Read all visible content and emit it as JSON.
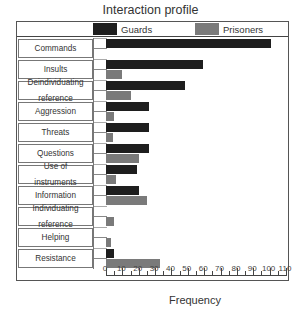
{
  "chart_data": {
    "type": "bar",
    "orientation": "horizontal",
    "title": "Interaction profile",
    "xlabel": "Frequency",
    "ylabel": "",
    "xlim": [
      0,
      110
    ],
    "xticks": [
      0,
      10,
      20,
      30,
      40,
      50,
      60,
      70,
      80,
      90,
      100,
      110
    ],
    "grid": false,
    "legend_position": "top",
    "categories": [
      "Commands",
      "Insults",
      "Deindividuating reference",
      "Aggression",
      "Threats",
      "Questions",
      "Use of instruments",
      "Information",
      "Individuating reference",
      "Helping",
      "Resistance"
    ],
    "category_display": [
      [
        "Commands"
      ],
      [
        "Insults"
      ],
      [
        "Deindividuating",
        "reference"
      ],
      [
        "Aggression"
      ],
      [
        "Threats"
      ],
      [
        "Questions"
      ],
      [
        "Use of",
        "instruments"
      ],
      [
        "Information"
      ],
      [
        "Individuating",
        "reference"
      ],
      [
        "Helping"
      ],
      [
        "Resistance"
      ]
    ],
    "series": [
      {
        "name": "Guards",
        "color": "#1e1e1e",
        "values": [
          101,
          59,
          48,
          26,
          26,
          26,
          19,
          20,
          0,
          0,
          5
        ]
      },
      {
        "name": "Prisoners",
        "color": "#7a7a7a",
        "values": [
          0,
          10,
          15,
          5,
          4,
          20,
          6,
          25,
          5,
          3,
          33
        ]
      }
    ]
  }
}
